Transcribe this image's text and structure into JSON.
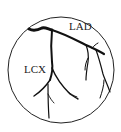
{
  "diagram": {
    "type": "coronary-artery-schematic",
    "labels": {
      "lad": "LAD",
      "lcx": "LCX"
    },
    "colors": {
      "stroke": "#111111",
      "background": "#ffffff"
    }
  }
}
